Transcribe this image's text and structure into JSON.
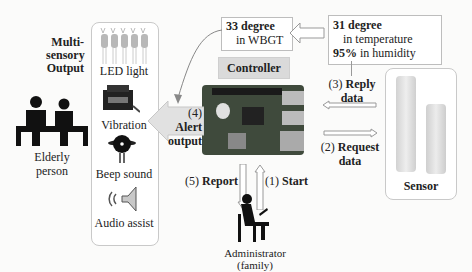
{
  "title_block": {
    "line1": "Multi-",
    "line2": "sensory",
    "line3": "Output"
  },
  "outputs": [
    {
      "label": "LED light",
      "icon": "led-icon"
    },
    {
      "label": "Vibration",
      "icon": "vibration-motor-icon"
    },
    {
      "label": "Beep sound",
      "icon": "buzzer-icon"
    },
    {
      "label": "Audio assist",
      "icon": "speaker-icon"
    }
  ],
  "elderly": {
    "line1": "Elderly",
    "line2": "person"
  },
  "wbgt": {
    "line1": "33 degree",
    "line2": "in WBGT"
  },
  "reading": {
    "temp_value": "31 degree",
    "temp_label": "in temperature",
    "hum_value": "95%",
    "hum_label": "in humidity"
  },
  "controller": {
    "label": "Controller"
  },
  "arrows": {
    "alert": {
      "num": "(4)",
      "line1": "Alert",
      "line2": "output"
    },
    "reply": {
      "num": "(3)",
      "line1": "Reply",
      "line2": "data"
    },
    "request": {
      "num": "(2)",
      "line1": "Request",
      "line2": "data"
    },
    "report": {
      "num": "(5)",
      "label": "Report"
    },
    "start": {
      "num": "(1)",
      "label": "Start"
    }
  },
  "sensor": {
    "label": "Sensor"
  },
  "admin": {
    "label": "Administrator (family)"
  }
}
